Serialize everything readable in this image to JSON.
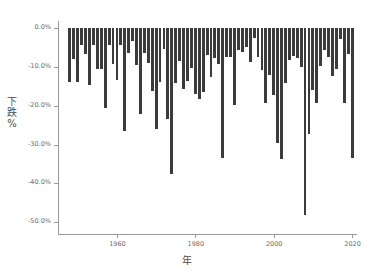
{
  "chart_data": {
    "type": "bar",
    "title": "",
    "subtitle": "",
    "xlabel": "年",
    "ylabel": "下跌%",
    "xlim": [
      1947.0,
      2021.0
    ],
    "ylim": [
      -53.0,
      1.5
    ],
    "grid": false,
    "legend": null,
    "bar_color": "#3b3b3b",
    "background_color": "#ffffff",
    "axis_color": "#9a9a9a",
    "xticks": [
      1960,
      1980,
      2000,
      2020
    ],
    "xtick_labels": [
      "1960",
      "1980",
      "2000",
      "2020"
    ],
    "yticks": [
      0,
      -10,
      -20,
      -30,
      -40,
      -50
    ],
    "ytick_labels": [
      "0.0%",
      "-10.0%",
      "-20.0%",
      "-30.0%",
      "-40.0%",
      "-50.0%"
    ],
    "categories": [
      1948,
      1949,
      1950,
      1951,
      1952,
      1953,
      1954,
      1955,
      1956,
      1957,
      1958,
      1959,
      1960,
      1961,
      1962,
      1963,
      1964,
      1965,
      1966,
      1967,
      1968,
      1969,
      1970,
      1971,
      1972,
      1973,
      1974,
      1975,
      1976,
      1977,
      1978,
      1979,
      1980,
      1981,
      1982,
      1983,
      1984,
      1985,
      1986,
      1987,
      1988,
      1989,
      1990,
      1991,
      1992,
      1993,
      1994,
      1995,
      1996,
      1997,
      1998,
      1999,
      2000,
      2001,
      2002,
      2003,
      2004,
      2005,
      2006,
      2007,
      2008,
      2009,
      2010,
      2011,
      2012,
      2013,
      2014,
      2015,
      2016,
      2017,
      2018,
      2019,
      2020
    ],
    "values": [
      -13.9,
      -8.1,
      -14.0,
      -4.5,
      -6.8,
      -14.8,
      -4.4,
      -10.6,
      -10.6,
      -20.7,
      -4.4,
      -9.2,
      -13.4,
      -4.4,
      -26.4,
      -6.5,
      -3.5,
      -9.6,
      -22.2,
      -6.6,
      -9.0,
      -16.3,
      -25.9,
      -13.9,
      -5.5,
      -23.4,
      -37.6,
      -14.1,
      -8.4,
      -15.6,
      -13.6,
      -10.2,
      -17.1,
      -18.4,
      -16.6,
      -6.9,
      -12.7,
      -7.8,
      -9.4,
      -33.5,
      -7.6,
      -7.6,
      -19.9,
      -5.6,
      -6.2,
      -5.0,
      -8.9,
      -2.5,
      -7.6,
      -10.8,
      -19.3,
      -12.1,
      -17.2,
      -29.7,
      -33.8,
      -14.1,
      -8.2,
      -7.2,
      -7.7,
      -10.1,
      -48.0,
      -27.2,
      -16.0,
      -19.4,
      -9.9,
      -5.8,
      -7.4,
      -12.4,
      -10.5,
      -2.8,
      -19.4,
      -6.8,
      -33.5
    ]
  }
}
